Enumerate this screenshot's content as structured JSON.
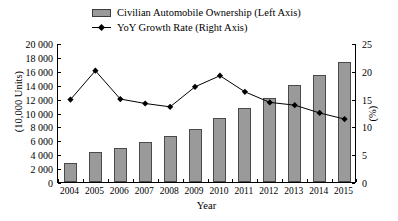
{
  "chart_data": {
    "type": "bar",
    "title": "",
    "xlabel": "Year",
    "ylabel": "(10,000 Units)",
    "y2label": "(%)",
    "categories": [
      "2004",
      "2005",
      "2006",
      "2007",
      "2008",
      "2009",
      "2010",
      "2011",
      "2012",
      "2013",
      "2014",
      "2015"
    ],
    "ylim": [
      0,
      20000
    ],
    "yticks": [
      "0",
      "2 000",
      "4 000",
      "6 000",
      "8 000",
      "10 000",
      "12 000",
      "14 000",
      "16 000",
      "18 000",
      "20 000"
    ],
    "ytick_values": [
      0,
      2000,
      4000,
      6000,
      8000,
      10000,
      12000,
      14000,
      16000,
      18000,
      20000
    ],
    "y2lim": [
      0,
      25
    ],
    "y2ticks": [
      "0",
      "5",
      "10",
      "15",
      "20",
      "25"
    ],
    "y2tick_values": [
      0,
      5,
      10,
      15,
      20,
      25
    ],
    "grid": false,
    "legend_position": "top-center",
    "series": [
      {
        "name": "Civilian Automobile Ownership (Left Axis)",
        "type": "bar",
        "axis": "left",
        "color": "#9a9a9a",
        "edge_color": "#4a4a4a",
        "values": [
          2700,
          4300,
          4900,
          5700,
          6600,
          7700,
          9200,
          10600,
          12100,
          13900,
          15400,
          17200
        ]
      },
      {
        "name": "YoY Growth Rate (Right Axis)",
        "type": "line",
        "axis": "right",
        "color": "#000000",
        "marker": "diamond",
        "values": [
          15.0,
          20.2,
          15.1,
          14.3,
          13.7,
          17.3,
          19.3,
          16.4,
          14.5,
          14.0,
          12.6,
          11.5
        ]
      }
    ]
  },
  "legend": {
    "items": [
      {
        "label": "Civilian Automobile Ownership (Left Axis)",
        "kind": "swatch"
      },
      {
        "label": "YoY Growth Rate (Right Axis)",
        "kind": "line"
      }
    ]
  }
}
